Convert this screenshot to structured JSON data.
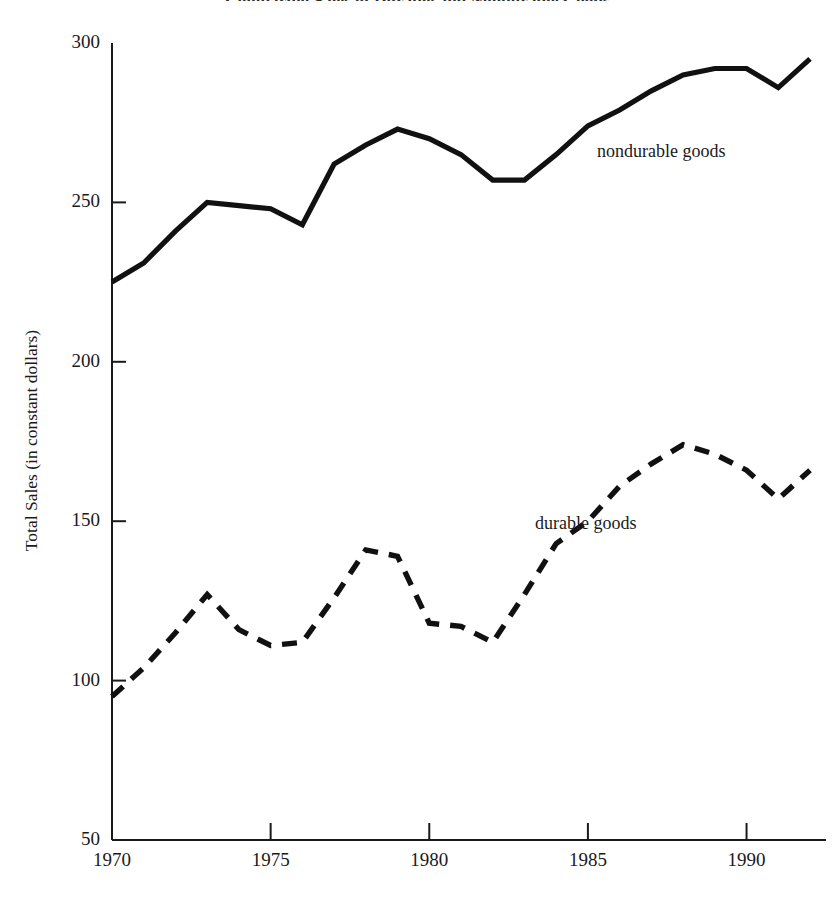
{
  "chart_data": {
    "type": "line",
    "title": "Comparing Sales of Durable and Nondurable Goods",
    "xlabel": "",
    "ylabel": "Total Sales (in constant dollars)",
    "xlim": [
      1970,
      1992
    ],
    "ylim": [
      50,
      300
    ],
    "grid": false,
    "legend_position": "inline-annotation",
    "x_ticks": [
      1970,
      1975,
      1980,
      1985,
      1990
    ],
    "x_tick_labels": [
      "1970",
      "1975",
      "1980",
      "1985",
      "1990"
    ],
    "y_ticks": [
      50,
      100,
      150,
      200,
      250,
      300
    ],
    "y_tick_labels": [
      "50",
      "100",
      "150",
      "200",
      "250",
      "300"
    ],
    "x": [
      1970,
      1971,
      1972,
      1973,
      1974,
      1975,
      1976,
      1977,
      1978,
      1979,
      1980,
      1981,
      1982,
      1983,
      1984,
      1985,
      1986,
      1987,
      1988,
      1989,
      1990,
      1991,
      1992
    ],
    "series": [
      {
        "name": "nondurable goods",
        "style": "solid",
        "color": "#111111",
        "values": [
          225,
          231,
          241,
          250,
          249,
          248,
          243,
          262,
          268,
          273,
          270,
          265,
          257,
          257,
          265,
          274,
          279,
          285,
          290,
          292,
          292,
          286,
          295
        ]
      },
      {
        "name": "durable goods",
        "style": "dashed",
        "color": "#111111",
        "values": [
          95,
          104,
          115,
          127,
          116,
          111,
          112,
          126,
          141,
          139,
          118,
          117,
          112,
          127,
          143,
          150,
          161,
          168,
          174,
          171,
          166,
          157,
          166
        ]
      }
    ]
  },
  "annotations": {
    "nondurable_label": "nondurable goods",
    "durable_label": "durable goods"
  }
}
